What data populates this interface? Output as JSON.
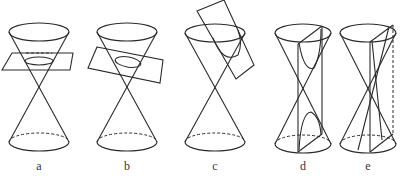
{
  "figure": {
    "panels": [
      {
        "id": "a",
        "label": "a",
        "section": "horizontal plane — circle"
      },
      {
        "id": "b",
        "label": "b",
        "section": "tilted plane — ellipse"
      },
      {
        "id": "c",
        "label": "c",
        "section": "plane parallel to generator — parabola"
      },
      {
        "id": "d",
        "label": "d",
        "section": "vertical plane — hyperbola"
      },
      {
        "id": "e",
        "label": "e",
        "section": "plane through apex — intersecting lines"
      }
    ]
  }
}
